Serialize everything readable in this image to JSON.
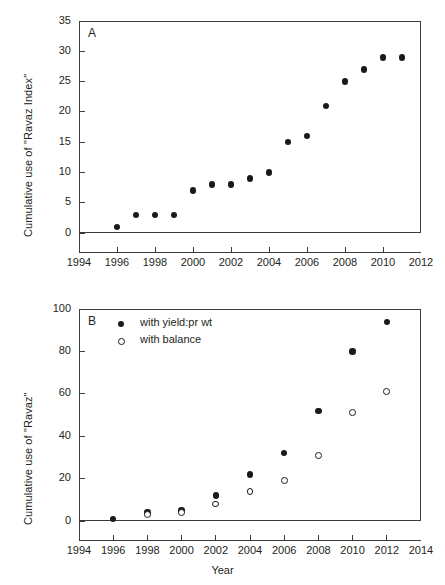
{
  "figure": {
    "background": "#ffffff",
    "ink_color": "#231f20",
    "marker_color": "#1a1a1a"
  },
  "chart_data": [
    {
      "type": "scatter",
      "panel": "A",
      "title": "",
      "xlabel": "",
      "ylabel": "Cumulative use of \"Ravaz Index\"",
      "xlim": [
        1994,
        2012
      ],
      "ylim": [
        0,
        35
      ],
      "xticks": [
        1994,
        1996,
        1998,
        2000,
        2002,
        2004,
        2006,
        2008,
        2010,
        2012
      ],
      "xtick_labels": [
        "1994",
        "1996",
        "1998",
        "2000",
        "2002",
        "2004",
        "2006",
        "2008",
        "2010",
        "2012"
      ],
      "xminorticks": [
        1995,
        1997,
        1999,
        2001,
        2003,
        2005,
        2007,
        2009,
        2011
      ],
      "yticks": [
        0,
        5,
        10,
        15,
        20,
        25,
        30,
        35
      ],
      "ytick_labels": [
        "0",
        "5",
        "10",
        "15",
        "20",
        "25",
        "30",
        "35"
      ],
      "grid": false,
      "legend": null,
      "series": [
        {
          "name": "Ravaz Index",
          "marker": "filled-circle",
          "x": [
            1996,
            1997,
            1998,
            1999,
            2000,
            2001,
            2002,
            2003,
            2004,
            2005,
            2006,
            2007,
            2008,
            2009,
            2010,
            2011
          ],
          "values": [
            1,
            3,
            3,
            3,
            7,
            8,
            8,
            9,
            10,
            15,
            16,
            21,
            25,
            27,
            29,
            29
          ]
        }
      ]
    },
    {
      "type": "scatter",
      "panel": "B",
      "title": "",
      "xlabel": "Year",
      "ylabel": "Cumulative use of \"Ravaz\"",
      "xlim": [
        1994,
        2014
      ],
      "ylim": [
        0,
        100
      ],
      "xticks": [
        1994,
        1996,
        1998,
        2000,
        2002,
        2004,
        2006,
        2008,
        2010,
        2012,
        2014
      ],
      "xtick_labels": [
        "1994",
        "1996",
        "1998",
        "2000",
        "2002",
        "2004",
        "2006",
        "2008",
        "2010",
        "2012",
        "2014"
      ],
      "xminorticks": [
        1995,
        1997,
        1999,
        2001,
        2003,
        2005,
        2007,
        2009,
        2011,
        2013
      ],
      "yticks": [
        0,
        20,
        40,
        60,
        80,
        100
      ],
      "ytick_labels": [
        "0",
        "20",
        "40",
        "60",
        "80",
        "100"
      ],
      "grid": false,
      "legend": {
        "position": "upper-left",
        "entries": [
          {
            "label": "with yield:pr wt",
            "marker": "filled-circle"
          },
          {
            "label": "with balance",
            "marker": "open-circle"
          }
        ]
      },
      "series": [
        {
          "name": "with yield:pr wt",
          "marker": "filled-circle",
          "x": [
            1996,
            1998,
            2000,
            2002,
            2004,
            2006,
            2008,
            2010,
            2012
          ],
          "values": [
            1,
            4,
            5,
            12,
            22,
            32,
            52,
            80,
            94
          ]
        },
        {
          "name": "with balance",
          "marker": "open-circle",
          "x": [
            1998,
            2000,
            2002,
            2004,
            2006,
            2008,
            2010,
            2012
          ],
          "values": [
            3,
            4,
            8,
            14,
            19,
            31,
            51,
            61
          ]
        }
      ]
    }
  ],
  "panels": {
    "a": {
      "letter": "A"
    },
    "b": {
      "letter": "B"
    }
  }
}
